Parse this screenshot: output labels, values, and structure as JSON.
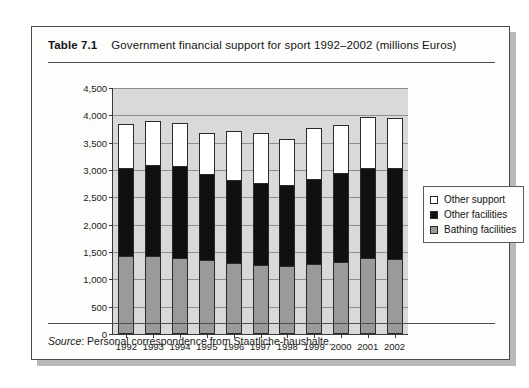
{
  "caption": {
    "table_number": "Table 7.1",
    "title": "Government financial support for sport 1992–2002 (millions Euros)"
  },
  "source": {
    "label": "Source",
    "text": ": Personal correspondence from Staatliche-haushalte."
  },
  "legend": {
    "items": [
      {
        "label": "Other support",
        "color": "#ffffff",
        "key": "other_support"
      },
      {
        "label": "Other facilities",
        "color": "#101010",
        "key": "other_facilities"
      },
      {
        "label": "Bathing facilities",
        "color": "#9a9a9a",
        "key": "bathing_facilities"
      }
    ]
  },
  "chart_data": {
    "type": "bar",
    "stacked": true,
    "title": "Government financial support for sport 1992–2002 (millions Euros)",
    "xlabel": "",
    "ylabel": "",
    "ylim": [
      0,
      4500
    ],
    "ytick_values": [
      0,
      500,
      1000,
      1500,
      2000,
      2500,
      3000,
      3500,
      4000,
      4500
    ],
    "ytick_labels": [
      "0",
      "500",
      "1,000",
      "1,500",
      "2,000",
      "2,500",
      "3,000",
      "3,500",
      "4,000",
      "4,500"
    ],
    "grid": true,
    "legend_position": "right",
    "categories": [
      "1992",
      "1993",
      "1994",
      "1995",
      "1996",
      "1997",
      "1998",
      "1999",
      "2000",
      "2001",
      "2002"
    ],
    "series": [
      {
        "name": "Bathing facilities",
        "color": "#9a9a9a",
        "values": [
          1400,
          1400,
          1380,
          1330,
          1280,
          1250,
          1230,
          1270,
          1300,
          1370,
          1360
        ]
      },
      {
        "name": "Other facilities",
        "color": "#101010",
        "values": [
          1620,
          1680,
          1670,
          1570,
          1520,
          1490,
          1470,
          1540,
          1620,
          1650,
          1660
        ]
      },
      {
        "name": "Other support",
        "color": "#ffffff",
        "values": [
          800,
          800,
          800,
          750,
          900,
          910,
          850,
          940,
          880,
          930,
          920
        ]
      }
    ],
    "totals": [
      3820,
      3880,
      3850,
      3650,
      3700,
      3650,
      3550,
      3750,
      3800,
      3950,
      3940
    ]
  }
}
